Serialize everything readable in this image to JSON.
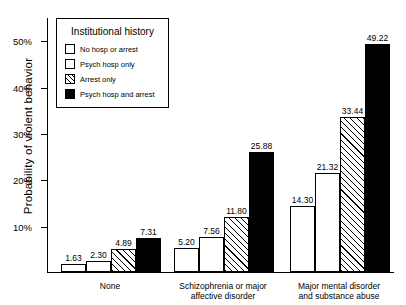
{
  "chart_data": {
    "type": "bar",
    "title": "",
    "xlabel": "",
    "ylabel": "Probability of violent behavior",
    "ylim": [
      0,
      55
    ],
    "ytick_values": [
      10,
      20,
      30,
      40,
      50
    ],
    "ytick_labels": [
      "10%",
      "20%",
      "30%",
      "40%",
      "50%"
    ],
    "grid": false,
    "legend_position": "top-left",
    "legend_title": "Institutional history",
    "categories": [
      "None",
      "Schizophrenia or major\naffective disorder",
      "Major mental disorder\nand substance abuse"
    ],
    "series": [
      {
        "name": "No hosp or arrest",
        "fill": "open",
        "values": [
          1.63,
          5.2,
          14.3
        ],
        "labels": [
          "1.63",
          "5.20",
          "14.30"
        ]
      },
      {
        "name": "Psych hosp only",
        "fill": "open",
        "values": [
          2.3,
          7.56,
          21.32
        ],
        "labels": [
          "2.30",
          "7.56",
          "21.32"
        ]
      },
      {
        "name": "Arrest only",
        "fill": "hatch",
        "values": [
          4.89,
          11.8,
          33.44
        ],
        "labels": [
          "4.89",
          "11.80",
          "33.44"
        ]
      },
      {
        "name": "Psych hosp and arrest",
        "fill": "solid",
        "values": [
          7.31,
          25.88,
          49.22
        ],
        "labels": [
          "7.31",
          "25.88",
          "49.22"
        ]
      }
    ]
  }
}
